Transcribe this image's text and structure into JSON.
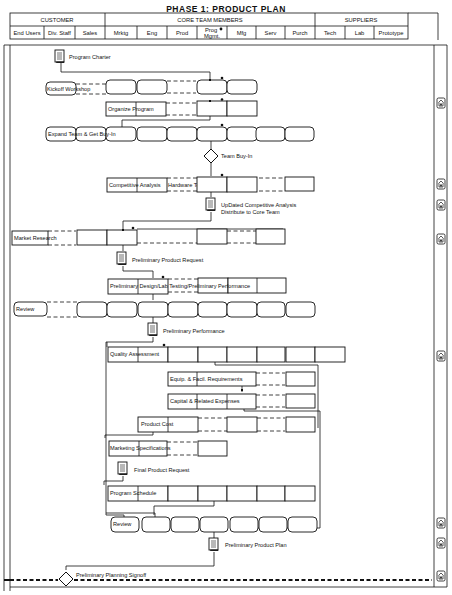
{
  "title": "PHASE 1: PRODUCT PLAN",
  "header": {
    "groups": [
      {
        "label": "CUSTOMER"
      },
      {
        "label": "CORE TEAM MEMBERS"
      },
      {
        "label": "SUPPLIERS"
      }
    ],
    "columns": [
      {
        "label": "End Users"
      },
      {
        "label": "Div. Staff"
      },
      {
        "label": "Sales"
      },
      {
        "label": "Mrktg"
      },
      {
        "label": "Eng"
      },
      {
        "label": "Prod"
      },
      {
        "label": "Prog",
        "label2": "Mgmt."
      },
      {
        "label": "Mfg"
      },
      {
        "label": "Serv"
      },
      {
        "label": "Purch"
      },
      {
        "label": "Tech"
      },
      {
        "label": "Lab"
      },
      {
        "label": "Prototype"
      }
    ]
  },
  "activities": {
    "program_charter": "Program Charter",
    "kickoff_workshop": "Kickoff Workshop",
    "organize_program": "Organize Program",
    "expand_team": "Expand Team & Get Buy-In",
    "team_buyin": "Team Buy-In",
    "competitive_analysis": "Competitive Analysis",
    "hardware_teardown": "Hardware Teardown",
    "updated_comp_1": "UpDated Competitive Analysis",
    "updated_comp_2": "Distribute to Core Team",
    "market_research": "Market Research",
    "prelim_product_request": "Preliminary Product Request",
    "prelim_design": "Preliminary Design/Lab Testing/Preliminary Performance",
    "review_1": "Review",
    "prelim_performance": "Preliminary Performance",
    "quality_assessment": "Quality Assessment",
    "equip_facil": "Equip. & Facil. Requirements",
    "capital_expenses": "Capital & Related Expenses",
    "product_cost": "Product Cost",
    "marketing_specs": "Marketing Specifications",
    "final_product_request": "Final Product Request",
    "program_schedule": "Program  Schedule",
    "review_2": "Review",
    "prelim_product_plan": "Preliminary  Product Plan",
    "prelim_planning_signoff": "Preliminary Planning Signoff"
  },
  "side_icons": [
    {
      "name": "template-icon",
      "y": 103
    },
    {
      "name": "template-icon",
      "y": 184
    },
    {
      "name": "template-icon",
      "y": 205
    },
    {
      "name": "template-icon",
      "y": 239
    },
    {
      "name": "template-icon",
      "y": 356
    },
    {
      "name": "template-icon",
      "y": 523
    },
    {
      "name": "template-icon",
      "y": 543
    },
    {
      "name": "template-icon",
      "y": 576
    }
  ]
}
